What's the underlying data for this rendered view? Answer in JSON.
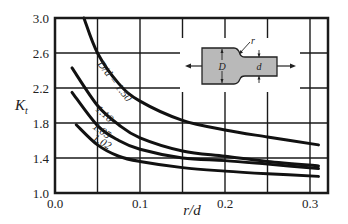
{
  "chart_data": {
    "type": "line",
    "title": "",
    "xlabel": "r/d",
    "ylabel": "K_t",
    "xlim": [
      0.0,
      0.31
    ],
    "ylim": [
      1.0,
      3.0
    ],
    "x_ticks": [
      "0.0",
      "0.1",
      "0.2",
      "0.3"
    ],
    "y_ticks": [
      "1.0",
      "1.4",
      "1.8",
      "2.2",
      "2.6",
      "3.0"
    ],
    "grid": true,
    "grid_x_step": 0.05,
    "grid_y_step": 0.4,
    "legend": "inline labels on curves",
    "series": [
      {
        "name": "D/d = 1.50",
        "label": "D/d = 1.50",
        "x": [
          0.034,
          0.05,
          0.075,
          0.1,
          0.15,
          0.2,
          0.25,
          0.31
        ],
        "y": [
          3.0,
          2.6,
          2.25,
          2.05,
          1.83,
          1.72,
          1.64,
          1.55
        ]
      },
      {
        "name": "D/d = 1.10",
        "label": "1.10",
        "x": [
          0.02,
          0.05,
          0.075,
          0.1,
          0.15,
          0.2,
          0.25,
          0.31
        ],
        "y": [
          2.43,
          2.0,
          1.78,
          1.63,
          1.48,
          1.42,
          1.36,
          1.31
        ]
      },
      {
        "name": "D/d = 1.05",
        "label": "1.05",
        "x": [
          0.02,
          0.05,
          0.075,
          0.1,
          0.15,
          0.2,
          0.25,
          0.31
        ],
        "y": [
          2.15,
          1.77,
          1.6,
          1.5,
          1.4,
          1.37,
          1.33,
          1.28
        ]
      },
      {
        "name": "D/d = 1.02",
        "label": "1.02",
        "x": [
          0.025,
          0.05,
          0.075,
          0.1,
          0.15,
          0.2,
          0.25,
          0.31
        ],
        "y": [
          1.78,
          1.55,
          1.42,
          1.36,
          1.29,
          1.25,
          1.22,
          1.19
        ]
      }
    ],
    "inset": {
      "description": "Stepped flat bar in axial tension with shoulder fillet",
      "labels": {
        "D": "D",
        "d": "d",
        "r": "r"
      }
    }
  }
}
